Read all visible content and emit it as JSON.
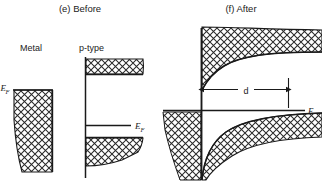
{
  "figure": {
    "type": "semiconductor-band-diagram",
    "panels": [
      {
        "id": "panel-before",
        "caption": "(e) Before",
        "labels": {
          "left_material": "Metal",
          "right_material": "p-type",
          "metal_fermi": "E",
          "metal_fermi_sub": "F",
          "semiconductor_fermi": "E",
          "semiconductor_fermi_sub": "F"
        },
        "description": "Flat-band diagram: isolated metal block on left with its Fermi level at top; p-type semiconductor on right showing flat conduction band (upper hatched region), flat valence band (lower hatched region) and a Fermi level line near the valence band."
      },
      {
        "id": "panel-after",
        "caption": "(f) After",
        "labels": {
          "depletion_width": "d",
          "fermi": "E",
          "fermi_sub": "F"
        },
        "description": "Contact diagram: metal and p-type semiconductor in contact. Bands bend downward toward the interface over a depletion width d; a common Fermi level line runs horizontally across both materials."
      }
    ],
    "style": {
      "line_color": "#1a1a1a",
      "hatch_color": "#2b2b2b",
      "background": "#ffffff",
      "hatch_pattern": "cross-hatch-diamond"
    }
  }
}
